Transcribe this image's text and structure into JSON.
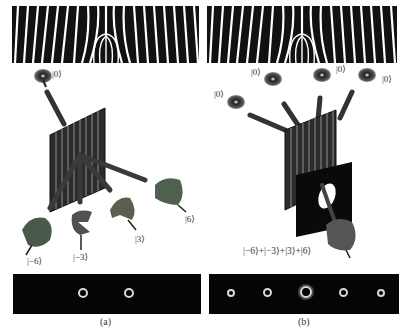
{
  "figure": {
    "panels": [
      {
        "id": "a",
        "caption": "(a)",
        "input_label": "|0⟩",
        "output_labels": [
          "|−6⟩",
          "|−3⟩",
          "|3⟩",
          "|6⟩"
        ],
        "screen_spots": 2
      },
      {
        "id": "b",
        "caption": "(b)",
        "input_labels": [
          "|0⟩",
          "|0⟩",
          "|0⟩",
          "|0⟩"
        ],
        "superposition_label": "|−6⟩+|−3⟩+|3⟩+|6⟩",
        "screen_spots": 5
      }
    ],
    "colors": {
      "fringe_dark": "#111111",
      "screen_bg": "#050505",
      "spot": "#d8d8d8",
      "beam": "#3a3a3a"
    }
  }
}
